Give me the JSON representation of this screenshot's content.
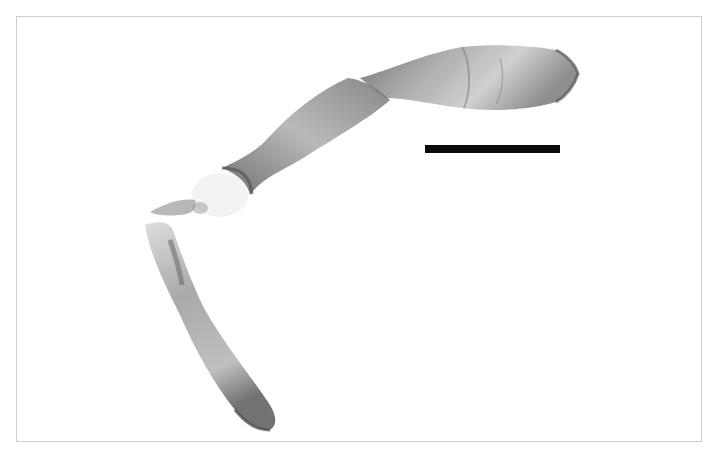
{
  "image": {
    "subject": "specimen-micrograph",
    "background_color": "#ffffff",
    "frame_color": "#cfcfcf",
    "specimen_tone": "#6e6e6e",
    "scale_bar": {
      "color": "#0a0a0a",
      "label": ""
    }
  }
}
